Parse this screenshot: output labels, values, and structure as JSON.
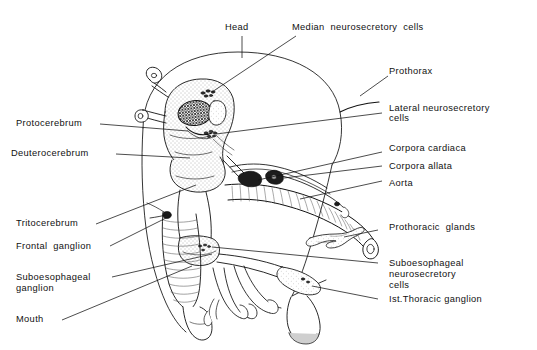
{
  "figure": {
    "kind": "labeled anatomical diagram",
    "background_color": "#ffffff",
    "line_color": "#111111"
  },
  "labels": {
    "head": "Head",
    "median_neurosecretory_cells": "Median  neurosecretory  cells",
    "prothorax": "Prothorax",
    "lateral_neurosecretory_cells_l1": "Lateral neurosecretory",
    "lateral_neurosecretory_cells_l2": "cells",
    "corpora_cardiaca": "Corpora cardiaca",
    "corpora_allata": "Corpora allata",
    "aorta": "Aorta",
    "prothoracic_glands": "Prothoracic  glands",
    "suboesophageal_nsc_l1": "Suboesophageal",
    "suboesophageal_nsc_l2": "neurosecretory",
    "suboesophageal_nsc_l3": "cells",
    "first_thoracic_ganglion": "Ist.Thoracic ganglion",
    "protocerebrum": "Protocerebrum",
    "deuterocerebrum": "Deuterocerebrum",
    "tritocerebrum": "Tritocerebrum",
    "frontal_ganglion": "Frontal  ganglion",
    "suboesophageal_ganglion_l1": "Suboesophageal",
    "suboesophageal_ganglion_l2": "ganglion",
    "mouth": "Mouth"
  }
}
